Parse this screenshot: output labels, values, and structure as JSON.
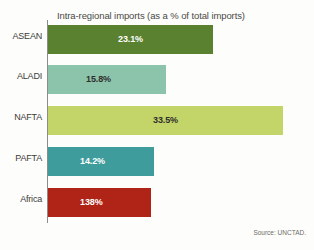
{
  "chart_data": {
    "type": "bar",
    "orientation": "horizontal",
    "title": "Intra-regional imports (as a % of total imports)",
    "xlabel": "",
    "ylabel": "",
    "categories": [
      "ASEAN",
      "ALADI",
      "NAFTA",
      "PAFTA",
      "Africa"
    ],
    "values": [
      23.1,
      15.8,
      33.5,
      14.2,
      138
    ],
    "value_labels": [
      "23.1%",
      "15.8%",
      "33.5%",
      "14.2%",
      "138%"
    ],
    "xlim": [
      0,
      36
    ],
    "grid": false,
    "legend": "none",
    "bar_colors": [
      "#59812f",
      "#8cc4ab",
      "#c3d468",
      "#3f9c9c",
      "#b02418"
    ],
    "label_colors": [
      "#ffffff",
      "#2f2f2b",
      "#2f2f2b",
      "#ffffff",
      "#ffffff"
    ],
    "bar_pixel_widths": [
      165,
      118,
      235,
      106,
      103
    ],
    "label_offsets_px": [
      70,
      38,
      105,
      32,
      32
    ],
    "source": "Source: UNCTAD."
  }
}
